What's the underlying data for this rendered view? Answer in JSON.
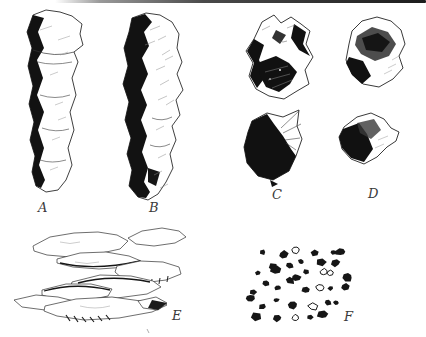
{
  "palette": {
    "paper": "#ffffff",
    "ink": "#1a1a1a",
    "label_color": "#3a3a3a"
  },
  "specimen_labels": {
    "a": "A",
    "b": "B",
    "c": "C",
    "d": "D",
    "e": "E",
    "f": "F"
  }
}
